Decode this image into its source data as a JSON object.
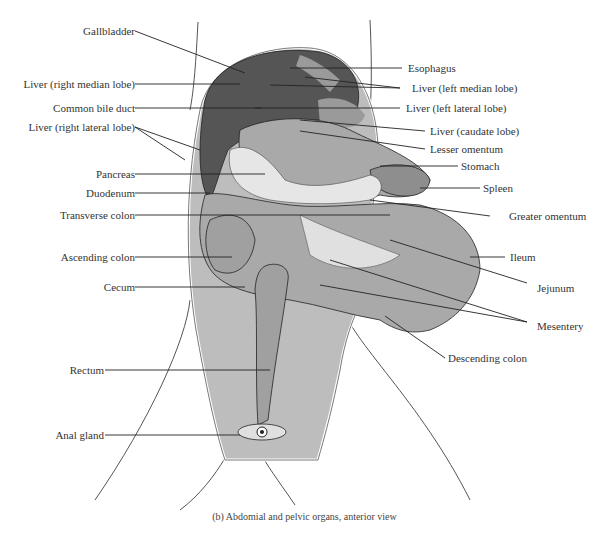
{
  "figure": {
    "caption": "(b) Abdomial and pelvic organs, anterior view",
    "colors": {
      "body_cavity": "#bdbdbd",
      "liver": "#555555",
      "organ": "#a9a9a9",
      "rectum": "#a0a0a0",
      "pancreas": "#e6e6e6",
      "line": "#222222"
    }
  },
  "labels_left": [
    {
      "text": "Gallbladder"
    },
    {
      "text": "Liver (right median lobe)"
    },
    {
      "text": "Common bile duct"
    },
    {
      "text": "Liver (right lateral lobe)"
    },
    {
      "text": "Pancreas"
    },
    {
      "text": "Duodenum"
    },
    {
      "text": "Transverse colon"
    },
    {
      "text": "Ascending colon"
    },
    {
      "text": "Cecum"
    },
    {
      "text": "Rectum"
    },
    {
      "text": "Anal gland"
    }
  ],
  "labels_right": [
    {
      "text": "Esophagus"
    },
    {
      "text": "Liver (left median lobe)"
    },
    {
      "text": "Liver (left lateral lobe)"
    },
    {
      "text": "Liver (caudate lobe)"
    },
    {
      "text": "Lesser omentum"
    },
    {
      "text": "Stomach"
    },
    {
      "text": "Spleen"
    },
    {
      "text": "Greater omentum"
    },
    {
      "text": "Ileum"
    },
    {
      "text": "Jejunum"
    },
    {
      "text": "Mesentery"
    },
    {
      "text": "Descending colon"
    }
  ]
}
